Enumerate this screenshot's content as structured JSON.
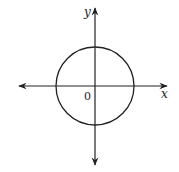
{
  "diagram": {
    "type": "circle-on-coordinate-axes",
    "axes": {
      "x_label": "x",
      "y_label": "y",
      "origin_label": "0"
    },
    "circle": {
      "center": [
        95,
        86
      ],
      "radius": 39,
      "stroke": "#222222"
    },
    "axis_color": "#222222"
  }
}
